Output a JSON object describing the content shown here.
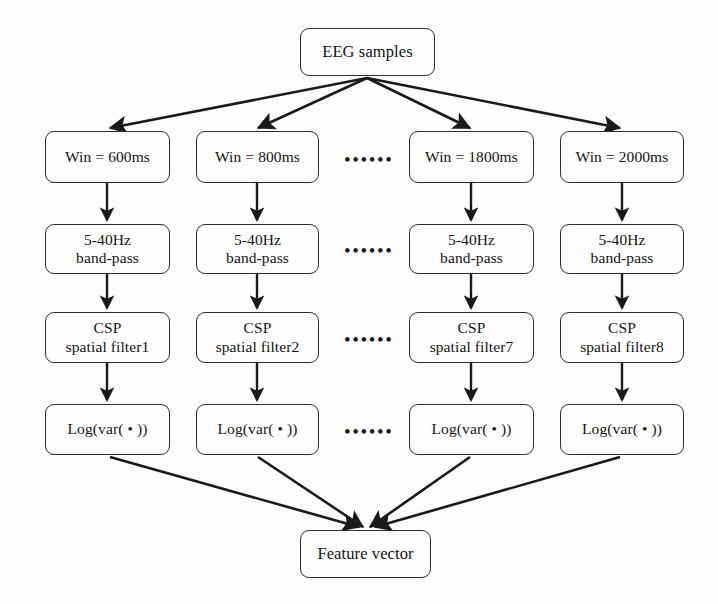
{
  "diagram": {
    "type": "flowchart",
    "colors": {
      "background": "#fdfdfc",
      "node_border": "#2f2f2f",
      "node_fill": "#fefefe",
      "text": "#141414",
      "edge": "#1a1a1a"
    },
    "source_node": {
      "label": "EEG samples"
    },
    "sink_node": {
      "label": "Feature vector"
    },
    "ellipsis": {
      "glyph": "••••••",
      "dot_count": 6
    },
    "rows": [
      {
        "name": "windowing",
        "cells": [
          {
            "line1": "Win = 600ms",
            "line2": ""
          },
          {
            "line1": "Win = 800ms",
            "line2": ""
          },
          {
            "line1": "Win = 1800ms",
            "line2": ""
          },
          {
            "line1": "Win = 2000ms",
            "line2": ""
          }
        ]
      },
      {
        "name": "band-pass-filter",
        "cells": [
          {
            "line1": "5-40Hz",
            "line2": "band-pass"
          },
          {
            "line1": "5-40Hz",
            "line2": "band-pass"
          },
          {
            "line1": "5-40Hz",
            "line2": "band-pass"
          },
          {
            "line1": "5-40Hz",
            "line2": "band-pass"
          }
        ]
      },
      {
        "name": "csp-spatial-filter",
        "cells": [
          {
            "line1": "CSP",
            "line2": "spatial filter1"
          },
          {
            "line1": "CSP",
            "line2": "spatial filter2"
          },
          {
            "line1": "CSP",
            "line2": "spatial filter7"
          },
          {
            "line1": "CSP",
            "line2": "spatial filter8"
          }
        ]
      },
      {
        "name": "log-variance",
        "cells": [
          {
            "line1": "Log(var( • ))",
            "line2": ""
          },
          {
            "line1": "Log(var( • ))",
            "line2": ""
          },
          {
            "line1": "Log(var( • ))",
            "line2": ""
          },
          {
            "line1": "Log(var( • ))",
            "line2": ""
          }
        ]
      }
    ]
  }
}
